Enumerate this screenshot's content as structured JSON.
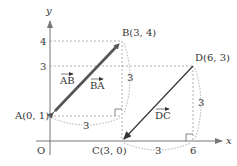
{
  "diagram": {
    "axes": {
      "x_label": "x",
      "y_label": "y",
      "origin_label": "O"
    },
    "y_ticks": [
      {
        "label": "4",
        "value": 4
      },
      {
        "label": "3",
        "value": 3
      }
    ],
    "x_ticks": [
      {
        "label": "6",
        "value": 6
      }
    ],
    "points": {
      "A": {
        "label": "A(0, 1)",
        "x": 0,
        "y": 1
      },
      "B": {
        "label": "B(3, 4)",
        "x": 3,
        "y": 4
      },
      "C": {
        "label": "C(3, 0)",
        "x": 3,
        "y": 0
      },
      "D": {
        "label": "D(6, 3)",
        "x": 6,
        "y": 3
      }
    },
    "vectors": [
      {
        "name": "AB",
        "label": "AB",
        "from": "A",
        "to": "B"
      },
      {
        "name": "BA",
        "label": "BA",
        "from": "B",
        "to": "A"
      },
      {
        "name": "DC",
        "label": "DC",
        "from": "D",
        "to": "C"
      }
    ],
    "dimensions": {
      "ab_horizontal": "3",
      "ab_vertical": "3",
      "dc_horizontal": "3",
      "dc_vertical": "3"
    },
    "colors": {
      "vector_ab": "#555555",
      "vector_dc": "#333333",
      "axis": "#777777",
      "dashed": "#888888"
    }
  }
}
